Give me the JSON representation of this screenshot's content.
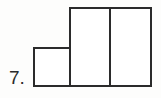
{
  "figure": {
    "problem_number": "7.",
    "kind": "rectangle-bar-figure",
    "bar_count": 3,
    "stroke_color": "#2b2b2b",
    "fill_color": "#ffffff",
    "background_color": "#fdfdfc",
    "bars": [
      {
        "id": "short",
        "label": "",
        "x": 33,
        "y": 47,
        "width": 38,
        "height": 40
      },
      {
        "id": "tall-left",
        "label": "",
        "x": 69,
        "y": 7,
        "width": 42,
        "height": 80
      },
      {
        "id": "tall-right",
        "label": "",
        "x": 109,
        "y": 7,
        "width": 43,
        "height": 80
      }
    ]
  },
  "chart_data": {
    "type": "bar",
    "title": "",
    "xlabel": "",
    "ylabel": "",
    "categories": [
      "1",
      "2",
      "3"
    ],
    "values": [
      40,
      80,
      80
    ],
    "ylim": [
      0,
      80
    ],
    "grid": false,
    "legend": null,
    "annotations": [
      "7."
    ]
  }
}
